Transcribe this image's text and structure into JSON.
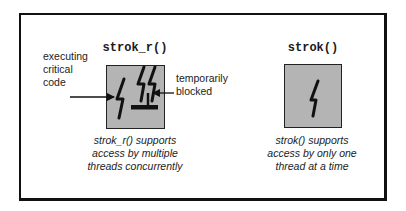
{
  "diagram": {
    "left": {
      "title": "strok_r()",
      "label_executing": [
        "executing",
        "critical",
        "code"
      ],
      "label_blocked": [
        "temporarily",
        "blocked"
      ],
      "caption": [
        "strok_r() supports",
        "access by multiple",
        "threads concurrently"
      ],
      "threads_executing": 1,
      "threads_blocked": 2
    },
    "right": {
      "title": "strok()",
      "caption": [
        "strok() supports",
        "access by only one",
        "thread at a time"
      ],
      "threads_executing": 1
    },
    "colors": {
      "box_fill": "#b4b4b4",
      "stroke": "#111111",
      "background": "#ffffff"
    }
  }
}
